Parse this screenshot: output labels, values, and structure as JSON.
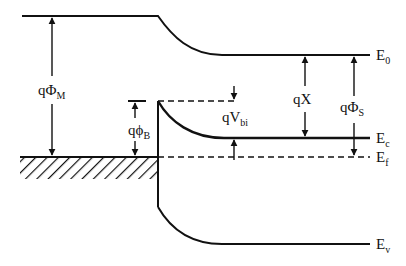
{
  "diagram": {
    "colors": {
      "line": "#111111",
      "background": "#ffffff"
    },
    "levels": {
      "E0": {
        "main": "E",
        "sub": "0"
      },
      "Ec": {
        "main": "E",
        "sub": "c"
      },
      "Ef": {
        "main": "E",
        "sub": "f"
      },
      "Ev": {
        "main": "E",
        "sub": "v"
      }
    },
    "quantities": {
      "phi_M": {
        "main": "qΦ",
        "sub": "M"
      },
      "phi_B": {
        "main": "qϕ",
        "sub": "B"
      },
      "V_bi": {
        "main": "qV",
        "sub": "bi"
      },
      "chi": {
        "main": "qX",
        "sub": ""
      },
      "phi_S": {
        "main": "qΦ",
        "sub": "S"
      }
    }
  }
}
